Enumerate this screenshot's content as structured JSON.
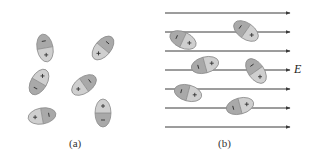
{
  "figure": {
    "colors": {
      "background": "#ffffff",
      "line": "#3a3a3a",
      "ellipse_negative": "#a9a9a9",
      "ellipse_positive": "#cfcfcf",
      "ellipse_stroke": "#8c8c8c",
      "sign": "#333333"
    },
    "panel_a": {
      "caption": "(a)",
      "description": "Randomly oriented polar molecules (dipoles) with no applied field",
      "dipoles": [
        {
          "cx": 45,
          "cy": 48,
          "angle": 70,
          "neg_side": "top",
          "plus": "+",
          "minus": "−"
        },
        {
          "cx": 103,
          "cy": 48,
          "angle": -50,
          "neg_side": "upper-right",
          "plus": "+",
          "minus": "−"
        },
        {
          "cx": 39,
          "cy": 82,
          "angle": -60,
          "neg_side": "lower-left",
          "plus": "+",
          "minus": "−"
        },
        {
          "cx": 84,
          "cy": 85,
          "angle": -35,
          "neg_side": "upper-right",
          "plus": "+",
          "minus": "−"
        },
        {
          "cx": 42,
          "cy": 116,
          "angle": -10,
          "neg_side": "right",
          "plus": "+",
          "minus": "−"
        },
        {
          "cx": 103,
          "cy": 113,
          "angle": 90,
          "neg_side": "bottom",
          "plus": "+",
          "minus": "−"
        }
      ]
    },
    "panel_b": {
      "caption": "(b)",
      "field_label": "E",
      "description": "Polar molecules partially aligned with an applied electric field E",
      "field_lines_y": [
        13,
        32,
        51,
        70,
        89,
        108,
        127
      ],
      "field_line_x_start": 165,
      "field_line_x_end": 290,
      "dipoles": [
        {
          "cx": 183,
          "cy": 40,
          "angle": 25,
          "neg_side": "left",
          "plus": "+",
          "minus": "−"
        },
        {
          "cx": 246,
          "cy": 31,
          "angle": 35,
          "neg_side": "upper-left",
          "plus": "+",
          "minus": "−"
        },
        {
          "cx": 205,
          "cy": 65,
          "angle": -15,
          "neg_side": "left",
          "plus": "+",
          "minus": "−"
        },
        {
          "cx": 256,
          "cy": 71,
          "angle": 55,
          "neg_side": "upper-left",
          "plus": "+",
          "minus": "−"
        },
        {
          "cx": 188,
          "cy": 93,
          "angle": 15,
          "neg_side": "left",
          "plus": "+",
          "minus": "−"
        },
        {
          "cx": 240,
          "cy": 106,
          "angle": -15,
          "neg_side": "left",
          "plus": "+",
          "minus": "−"
        }
      ]
    }
  }
}
